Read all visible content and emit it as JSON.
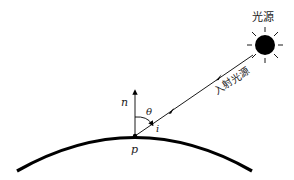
{
  "diagram": {
    "type": "reflection-geometry",
    "labels": {
      "light_source": "光源",
      "incident_light": "入射光源",
      "normal": "n",
      "angle": "θ",
      "incident": "i",
      "point": "p"
    },
    "colors": {
      "stroke": "#000000",
      "text": "#222222",
      "background": "#ffffff"
    }
  }
}
